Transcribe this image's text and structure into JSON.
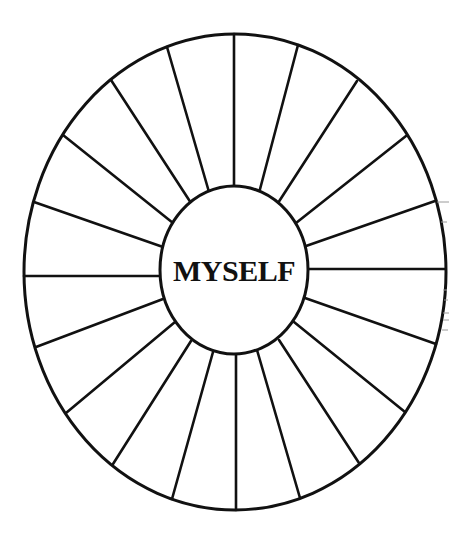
{
  "diagram": {
    "type": "radial-wheel",
    "center_label": "MYSELF",
    "sector_count": 20,
    "colors": {
      "stroke": "#111111",
      "background": "#ffffff",
      "artifact_ticks": "#9a9a9a"
    },
    "outer_ellipse": {
      "cx": 235,
      "cy": 272,
      "rx": 211,
      "ry": 238
    },
    "inner_ellipse": {
      "cx": 234,
      "cy": 270,
      "rx": 74,
      "ry": 84
    },
    "spokes": [
      {
        "x1": 234,
        "y1": 187,
        "x2": 234,
        "y2": 34
      },
      {
        "x1": 259,
        "y1": 193,
        "x2": 298,
        "y2": 45
      },
      {
        "x1": 278,
        "y1": 203,
        "x2": 357,
        "y2": 81
      },
      {
        "x1": 296,
        "y1": 223,
        "x2": 406,
        "y2": 136
      },
      {
        "x1": 306,
        "y1": 246,
        "x2": 435,
        "y2": 201
      },
      {
        "x1": 308,
        "y1": 269,
        "x2": 445,
        "y2": 269
      },
      {
        "x1": 305,
        "y1": 298,
        "x2": 436,
        "y2": 344
      },
      {
        "x1": 294,
        "y1": 322,
        "x2": 405,
        "y2": 412
      },
      {
        "x1": 279,
        "y1": 340,
        "x2": 359,
        "y2": 463
      },
      {
        "x1": 257,
        "y1": 350,
        "x2": 300,
        "y2": 498
      },
      {
        "x1": 236,
        "y1": 354,
        "x2": 236,
        "y2": 510
      },
      {
        "x1": 213,
        "y1": 352,
        "x2": 172,
        "y2": 499
      },
      {
        "x1": 191,
        "y1": 341,
        "x2": 113,
        "y2": 464
      },
      {
        "x1": 175,
        "y1": 322,
        "x2": 66,
        "y2": 413
      },
      {
        "x1": 163,
        "y1": 299,
        "x2": 36,
        "y2": 347
      },
      {
        "x1": 160,
        "y1": 276,
        "x2": 24,
        "y2": 276
      },
      {
        "x1": 163,
        "y1": 247,
        "x2": 34,
        "y2": 202
      },
      {
        "x1": 173,
        "y1": 223,
        "x2": 63,
        "y2": 135
      },
      {
        "x1": 191,
        "y1": 203,
        "x2": 111,
        "y2": 80
      },
      {
        "x1": 209,
        "y1": 192,
        "x2": 167,
        "y2": 47
      }
    ],
    "artifact_ticks": [
      {
        "x1": 437,
        "y1": 202,
        "x2": 449,
        "y2": 202
      },
      {
        "x1": 441,
        "y1": 222,
        "x2": 447,
        "y2": 222
      },
      {
        "x1": 443,
        "y1": 290,
        "x2": 447,
        "y2": 290
      },
      {
        "x1": 444,
        "y1": 300,
        "x2": 448,
        "y2": 300
      },
      {
        "x1": 443,
        "y1": 313,
        "x2": 449,
        "y2": 313
      },
      {
        "x1": 443,
        "y1": 320,
        "x2": 449,
        "y2": 320
      },
      {
        "x1": 442,
        "y1": 330,
        "x2": 448,
        "y2": 330
      }
    ]
  }
}
